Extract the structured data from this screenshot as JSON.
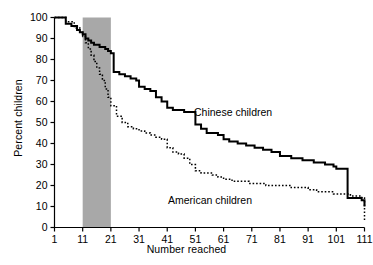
{
  "chart_data": {
    "type": "line",
    "title": "",
    "subtitle": "",
    "xlabel": "Number reached",
    "ylabel": "Percent children",
    "xlim": [
      1,
      111
    ],
    "ylim": [
      0,
      100
    ],
    "xticks": [
      1,
      11,
      21,
      31,
      41,
      51,
      61,
      71,
      81,
      91,
      101,
      111
    ],
    "xticklabels": [
      "1",
      "11",
      "21",
      "31",
      "41",
      "51",
      "61",
      "71",
      "81",
      "91",
      "101",
      "111"
    ],
    "yticks": [
      0,
      10,
      20,
      30,
      40,
      50,
      60,
      70,
      80,
      90,
      100
    ],
    "yticklabels": [
      "0",
      "10",
      "20",
      "30",
      "40",
      "50",
      "60",
      "70",
      "80",
      "90",
      "100"
    ],
    "grid": false,
    "legend_position": "inline-annotations",
    "drawstyle": "steps-post",
    "shaded_region": {
      "name": "highlight-band",
      "x_start": 11,
      "x_end": 21,
      "color": "#a8a8a8"
    },
    "annotations": [
      {
        "name": "chinese-children-label",
        "text": "Chinese children",
        "x": 52,
        "y": 57
      },
      {
        "name": "american-children-label",
        "text": "American children",
        "x": 44,
        "y": 22
      }
    ],
    "series": [
      {
        "name": "Chinese children",
        "style": "solid",
        "color": "#000000",
        "linewidth": 2,
        "x": [
          1,
          3,
          5,
          7,
          9,
          10,
          11,
          12,
          13,
          14,
          15,
          16,
          17,
          18,
          19,
          20,
          21,
          22,
          24,
          26,
          28,
          30,
          31,
          33,
          35,
          37,
          39,
          41,
          43,
          45,
          47,
          49,
          51,
          53,
          55,
          57,
          59,
          61,
          63,
          66,
          69,
          72,
          75,
          78,
          81,
          85,
          89,
          93,
          97,
          100,
          101,
          105,
          109,
          110,
          111
        ],
        "y": [
          100,
          100,
          97,
          96,
          94,
          93,
          92,
          90,
          89,
          88,
          87,
          87,
          86,
          86,
          85,
          84,
          83,
          74,
          73,
          72,
          71,
          70,
          67,
          66,
          65,
          62,
          60,
          57,
          56,
          56,
          55,
          55,
          49,
          47,
          45,
          45,
          44,
          42,
          41,
          40,
          39,
          38,
          37,
          36,
          34,
          33,
          32,
          31,
          30,
          29,
          28,
          14,
          14,
          13,
          10
        ]
      },
      {
        "name": "American children",
        "style": "dotted",
        "color": "#000000",
        "linewidth": 1.5,
        "x": [
          1,
          5,
          8,
          10,
          11,
          12,
          13,
          14,
          15,
          16,
          17,
          18,
          19,
          20,
          21,
          23,
          25,
          27,
          29,
          31,
          33,
          35,
          37,
          39,
          41,
          43,
          45,
          47,
          49,
          51,
          53,
          55,
          57,
          59,
          61,
          64,
          67,
          70,
          73,
          76,
          79,
          82,
          85,
          88,
          91,
          94,
          97,
          100,
          103,
          106,
          109,
          110,
          111
        ],
        "y": [
          100,
          98,
          95,
          93,
          91,
          88,
          85,
          82,
          79,
          76,
          73,
          70,
          66,
          62,
          58,
          53,
          50,
          48,
          47,
          46,
          45,
          44,
          43,
          42,
          38,
          36,
          35,
          33,
          30,
          27,
          26,
          26,
          25,
          24,
          23,
          22,
          22,
          21,
          21,
          20,
          20,
          20,
          19,
          19,
          18,
          17,
          17,
          16,
          16,
          15,
          15,
          14,
          3
        ]
      }
    ]
  }
}
